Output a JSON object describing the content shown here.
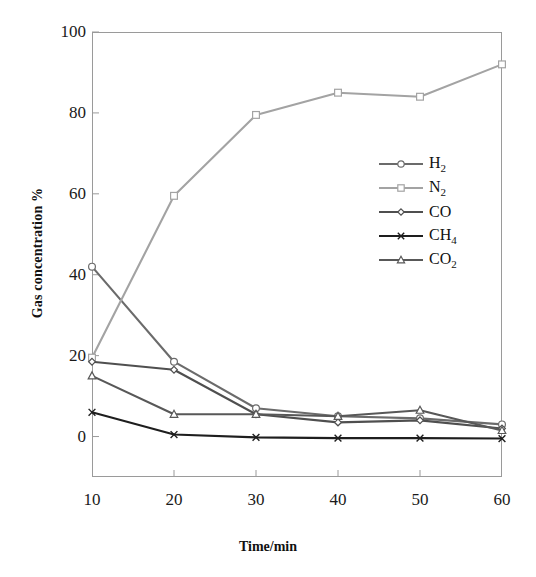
{
  "chart_data": {
    "type": "line",
    "title": "",
    "xlabel": "Time/min",
    "ylabel": "Gas concentration %",
    "x": [
      10,
      20,
      30,
      40,
      50,
      60
    ],
    "xtick_labels": [
      "10",
      "20",
      "30",
      "40",
      "50",
      "60"
    ],
    "ytick_labels": [
      "0",
      "20",
      "40",
      "60",
      "80",
      "100"
    ],
    "ytick_values": [
      0,
      20,
      40,
      60,
      80,
      100
    ],
    "xlim": [
      10,
      60
    ],
    "ylim": [
      -10,
      100
    ],
    "grid": false,
    "legend_position": "center-right",
    "series": [
      {
        "name": "H2",
        "label_text": "H",
        "label_sub": "2",
        "marker": "circle",
        "color": "#6b6b6b",
        "values": [
          42,
          18.5,
          7,
          5,
          4.5,
          3
        ]
      },
      {
        "name": "N2",
        "label_text": "N",
        "label_sub": "2",
        "marker": "square",
        "color": "#a3a3a3",
        "values": [
          19.5,
          59.5,
          79.5,
          85,
          84,
          92
        ]
      },
      {
        "name": "CO",
        "label_text": "CO",
        "label_sub": "",
        "marker": "diamond",
        "color": "#4f4f4f",
        "values": [
          18.5,
          16.5,
          5.5,
          3.5,
          4,
          2
        ]
      },
      {
        "name": "CH4",
        "label_text": "CH",
        "label_sub": "4",
        "marker": "cross",
        "color": "#1e1e1e",
        "values": [
          6,
          0.5,
          -0.2,
          -0.4,
          -0.4,
          -0.5
        ]
      },
      {
        "name": "CO2",
        "label_text": "CO",
        "label_sub": "2",
        "marker": "triangle",
        "color": "#585858",
        "values": [
          15,
          5.5,
          5.5,
          5,
          6.5,
          1.5
        ]
      }
    ]
  }
}
